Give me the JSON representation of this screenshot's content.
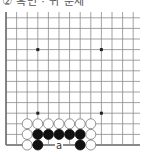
{
  "caption": "② 흑번 · 귀 문제",
  "board": {
    "origin": {
      "x": 6,
      "y": 145
    },
    "spacing": 10.6,
    "cols": 13,
    "rows": 13,
    "line_color": "#8a8a8a",
    "edge_color": "#777777",
    "star_points": [
      [
        3,
        3
      ],
      [
        9,
        3
      ],
      [
        3,
        9
      ],
      [
        9,
        9
      ]
    ],
    "stones": [
      {
        "color": "white",
        "col": 2,
        "row": 2
      },
      {
        "color": "white",
        "col": 3,
        "row": 2
      },
      {
        "color": "white",
        "col": 4,
        "row": 2
      },
      {
        "color": "white",
        "col": 5,
        "row": 2
      },
      {
        "color": "white",
        "col": 6,
        "row": 2
      },
      {
        "color": "white",
        "col": 7,
        "row": 2
      },
      {
        "color": "white",
        "col": 8,
        "row": 2
      },
      {
        "color": "white",
        "col": 2,
        "row": 1
      },
      {
        "color": "black",
        "col": 3,
        "row": 1
      },
      {
        "color": "black",
        "col": 4,
        "row": 1
      },
      {
        "color": "black",
        "col": 5,
        "row": 1
      },
      {
        "color": "black",
        "col": 6,
        "row": 1
      },
      {
        "color": "black",
        "col": 7,
        "row": 1
      },
      {
        "color": "white",
        "col": 8,
        "row": 1
      },
      {
        "color": "white",
        "col": 2,
        "row": 0
      },
      {
        "color": "black",
        "col": 3,
        "row": 0
      },
      {
        "color": "black",
        "col": 7,
        "row": 0
      },
      {
        "color": "white",
        "col": 8,
        "row": 0
      }
    ],
    "labels": [
      {
        "text": "a",
        "col": 5,
        "row": 0
      }
    ]
  }
}
